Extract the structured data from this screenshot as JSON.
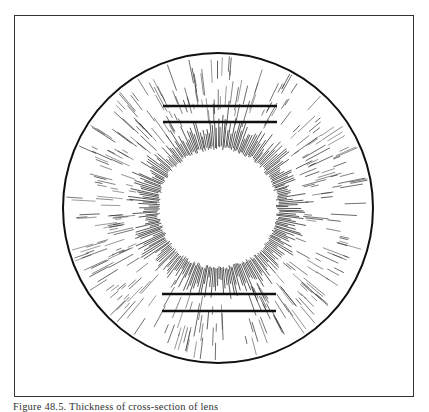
{
  "figure": {
    "caption": "Figure 48.5. Thickness of cross-section of lens",
    "outer_circle": {
      "cx": 218,
      "cy": 208,
      "r": 155,
      "stroke": "#111111",
      "stroke_width": 2
    },
    "inner_clear_disc": {
      "cx": 218,
      "cy": 208,
      "r": 58
    },
    "hatching": {
      "color": "#222222",
      "dense_strokes": 260,
      "sparse_strokes": 170
    },
    "bars": [
      {
        "x1": 163,
        "y1": 106,
        "x2": 277,
        "y2": 106
      },
      {
        "x1": 163,
        "y1": 122,
        "x2": 277,
        "y2": 122
      },
      {
        "x1": 162,
        "y1": 294,
        "x2": 276,
        "y2": 294
      },
      {
        "x1": 162,
        "y1": 311,
        "x2": 276,
        "y2": 311
      }
    ],
    "bar_color": "#111111",
    "bar_width": 2.4
  }
}
